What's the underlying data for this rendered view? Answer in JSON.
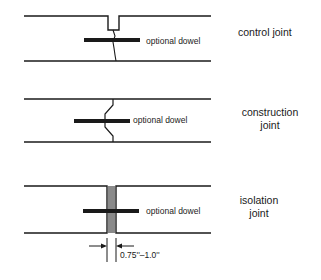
{
  "joints": [
    {
      "type": "control",
      "title_lines": [
        "control joint"
      ],
      "dowel_label": "optional dowel"
    },
    {
      "type": "construction",
      "title_lines": [
        "construction",
        "joint"
      ],
      "dowel_label": "optional dowel"
    },
    {
      "type": "isolation",
      "title_lines": [
        "isolation",
        "joint"
      ],
      "dowel_label": "optional dowel",
      "gap_dimension": "0.75''–1.0''"
    }
  ],
  "colors": {
    "line": "#1a1a1a",
    "filler": "#8a8a8a",
    "background": "#ffffff"
  }
}
